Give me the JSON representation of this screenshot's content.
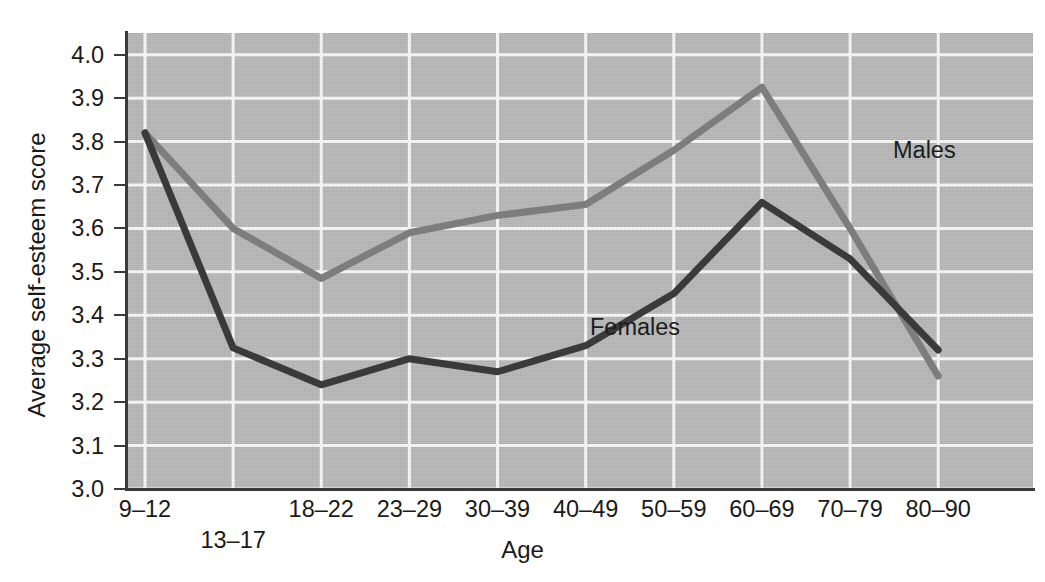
{
  "chart_data": {
    "type": "line",
    "title": "",
    "xlabel": "Age",
    "ylabel": "Average self-esteem score",
    "categories": [
      "9–12",
      "13–17",
      "18–22",
      "23–29",
      "30–39",
      "40–49",
      "50–59",
      "60–69",
      "70–79",
      "80–90"
    ],
    "xtick_labels": [
      "9–12",
      "13–17",
      "18–22",
      "23–29",
      "30–39",
      "40–49",
      "50–59",
      "60–69",
      "70–79",
      "80–90"
    ],
    "ytick_labels": [
      "4.0",
      "3.9",
      "3.8",
      "3.7",
      "3.6",
      "3.5",
      "3.4",
      "3.3",
      "3.2",
      "3.1",
      "3.0"
    ],
    "ytick_values": [
      4.0,
      3.9,
      3.8,
      3.7,
      3.6,
      3.5,
      3.4,
      3.3,
      3.2,
      3.1,
      3.0
    ],
    "ylim": [
      3.0,
      4.05
    ],
    "grid": "both",
    "legend": "inline-annotations",
    "series": [
      {
        "name": "Males",
        "color": "#7d7d7d",
        "values": [
          3.82,
          3.6,
          3.485,
          3.59,
          3.63,
          3.655,
          3.78,
          3.925,
          3.6,
          3.26
        ]
      },
      {
        "name": "Females",
        "color": "#3a3a3a",
        "values": [
          3.82,
          3.325,
          3.24,
          3.3,
          3.27,
          3.33,
          3.45,
          3.66,
          3.53,
          3.32
        ]
      }
    ],
    "annotations": [
      {
        "text": "Males",
        "series": "Males"
      },
      {
        "text": "Females",
        "series": "Females"
      }
    ],
    "colors": {
      "plot_background": "#b9b9b9",
      "gridline": "#f2f2f2",
      "axis": "#3a3a3a",
      "males_line": "#7d7d7d",
      "females_line": "#3a3a3a",
      "page_background": "#ffffff"
    }
  }
}
